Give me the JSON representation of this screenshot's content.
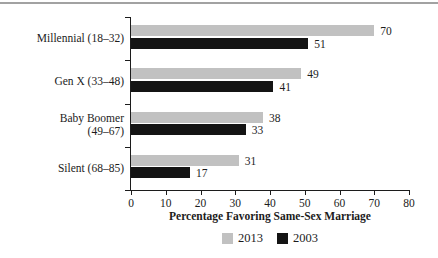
{
  "chart_data": {
    "type": "bar",
    "orientation": "horizontal",
    "title": "",
    "categories": [
      "Millennial (18–32)",
      "Gen X (33–48)",
      "Baby Boomer (49–67)",
      "Silent (68–85)"
    ],
    "category_label_lines": [
      [
        "Millennial (18–32)"
      ],
      [
        "Gen X (33–48)"
      ],
      [
        "Baby Boomer",
        "(49–67)"
      ],
      [
        "Silent (68–85)"
      ]
    ],
    "series": [
      {
        "name": "2013",
        "color": "#c1c1c1",
        "values": [
          70,
          49,
          38,
          31
        ]
      },
      {
        "name": "2003",
        "color": "#141414",
        "values": [
          51,
          41,
          33,
          17
        ]
      }
    ],
    "xlabel": "Percentage Favoring Same-Sex Marriage",
    "ylabel": "",
    "xlim": [
      0,
      80
    ],
    "xticks": [
      0,
      10,
      20,
      30,
      40,
      50,
      60,
      70,
      80
    ],
    "value_labels": true,
    "grid": false,
    "legend_position": "bottom"
  },
  "style": {
    "axis_color": "#1c1c1c",
    "text_color": "#1c1c1c",
    "top_rule_color": "#a2a2a2",
    "background": "#ffffff"
  }
}
